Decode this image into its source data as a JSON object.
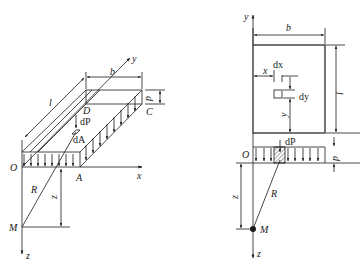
{
  "figure_left": {
    "title": "Isometric view of uniformly loaded rectangular area",
    "labels": {
      "y_axis": "y",
      "x_axis": "x",
      "z_axis": "z",
      "origin": "O",
      "corner_A": "A",
      "corner_C": "C",
      "corner_D": "D",
      "width": "b",
      "length": "l",
      "load": "p",
      "point_load": "dP",
      "area_element": "dA",
      "distance": "R",
      "point": "M",
      "depth": "z"
    }
  },
  "figure_right": {
    "title": "Plan and section of loaded rectangular area",
    "labels": {
      "y_axis": "y",
      "z_axis": "z",
      "origin": "O",
      "width": "b",
      "length": "l",
      "x_offset": "x",
      "y_offset": "y",
      "element_dx": "dx",
      "element_dy": "dy",
      "point_load": "dP",
      "load": "p",
      "distance": "R",
      "point": "M",
      "depth": "z"
    }
  },
  "colors": {
    "line": "#1a1a1a",
    "background": "#ffffff"
  }
}
